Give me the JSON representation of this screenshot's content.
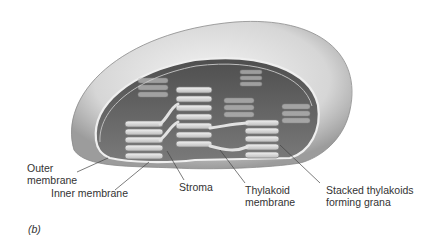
{
  "figure": {
    "panel_label": "(b)",
    "labels": {
      "outer_membrane_1": "Outer",
      "outer_membrane_2": "membrane",
      "inner_membrane": "Inner membrane",
      "stroma": "Stroma",
      "thylakoid_membrane_1": "Thylakoid",
      "thylakoid_membrane_2": "membrane",
      "grana_1": "Stacked thylakoids",
      "grana_2": "forming grana"
    },
    "colors": {
      "outer_shell": "#d9d9d9",
      "shell_shadow": "#9a9a9a",
      "interior": "#6f6f6f",
      "thylakoid": "#e6e6e6",
      "leader_line": "#444444"
    }
  }
}
